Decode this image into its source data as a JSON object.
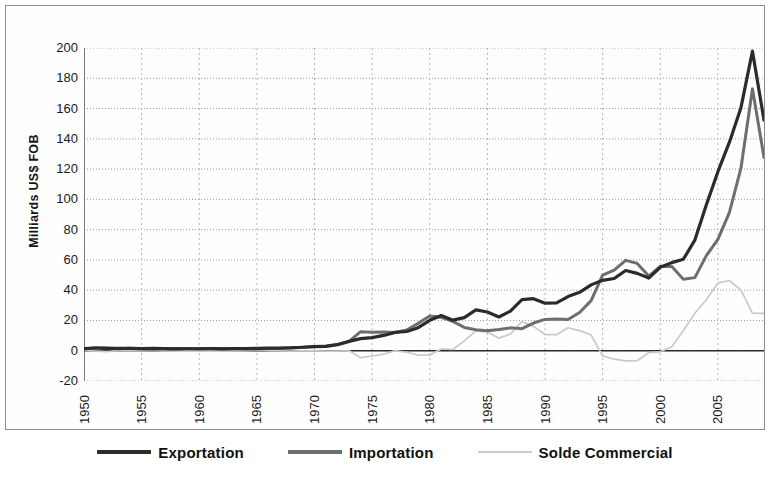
{
  "chart_data": {
    "type": "line",
    "title": "",
    "xlabel": "",
    "ylabel": "Milliards US$ FOB",
    "xlim": [
      1950,
      2009
    ],
    "ylim": [
      -20,
      200
    ],
    "ytick_labels": [
      "200",
      "180",
      "160",
      "140",
      "120",
      "100",
      "80",
      "60",
      "40",
      "20",
      "0",
      "-20"
    ],
    "ytick_values": [
      200,
      180,
      160,
      140,
      120,
      100,
      80,
      60,
      40,
      20,
      0,
      -20
    ],
    "xtick_labels": [
      "1950",
      "1955",
      "1960",
      "1965",
      "1970",
      "1975",
      "1980",
      "1985",
      "1990",
      "1995",
      "2000",
      "2005"
    ],
    "xtick_values": [
      1950,
      1955,
      1960,
      1965,
      1970,
      1975,
      1980,
      1985,
      1990,
      1995,
      2000,
      2005
    ],
    "grid": true,
    "legend_position": "bottom",
    "x": [
      1950,
      1951,
      1952,
      1953,
      1954,
      1955,
      1956,
      1957,
      1958,
      1959,
      1960,
      1961,
      1962,
      1963,
      1964,
      1965,
      1966,
      1967,
      1968,
      1969,
      1970,
      1971,
      1972,
      1973,
      1974,
      1975,
      1976,
      1977,
      1978,
      1979,
      1980,
      1981,
      1982,
      1983,
      1984,
      1985,
      1986,
      1987,
      1988,
      1989,
      1990,
      1991,
      1992,
      1993,
      1994,
      1995,
      1996,
      1997,
      1998,
      1999,
      2000,
      2001,
      2002,
      2003,
      2004,
      2005,
      2006,
      2007,
      2008,
      2009
    ],
    "series": [
      {
        "name": "Exportation",
        "color": "#2b2b2b",
        "values": [
          1.4,
          1.8,
          1.4,
          1.5,
          1.6,
          1.4,
          1.5,
          1.4,
          1.2,
          1.3,
          1.3,
          1.4,
          1.2,
          1.4,
          1.4,
          1.6,
          1.7,
          1.7,
          1.9,
          2.3,
          2.7,
          2.9,
          4.0,
          6.2,
          8.0,
          8.7,
          10.1,
          12.1,
          12.7,
          15.2,
          20.1,
          23.3,
          20.2,
          21.9,
          27.0,
          25.6,
          22.3,
          26.2,
          33.8,
          34.4,
          31.4,
          31.6,
          35.8,
          38.6,
          43.5,
          46.5,
          47.7,
          53.0,
          51.1,
          48.0,
          55.1,
          58.2,
          60.4,
          73.1,
          96.5,
          118.3,
          137.8,
          160.6,
          197.9,
          152.3
        ]
      },
      {
        "name": "Importation",
        "color": "#6e6e6e",
        "values": [
          1.1,
          2.0,
          2.0,
          1.3,
          1.6,
          1.3,
          1.2,
          1.5,
          1.4,
          1.4,
          1.5,
          1.5,
          1.5,
          1.5,
          1.3,
          1.1,
          1.5,
          1.7,
          2.1,
          2.3,
          2.8,
          3.2,
          4.2,
          6.2,
          12.6,
          12.2,
          12.4,
          12.0,
          13.7,
          18.1,
          23.0,
          22.1,
          19.4,
          15.4,
          13.9,
          13.2,
          14.0,
          15.1,
          14.6,
          18.3,
          20.7,
          21.0,
          20.6,
          25.3,
          33.1,
          49.9,
          53.3,
          59.7,
          57.7,
          49.3,
          55.8,
          55.6,
          47.2,
          48.3,
          62.8,
          73.6,
          91.4,
          120.6,
          173.1,
          127.6
        ]
      },
      {
        "name": "Solde Commercial",
        "color": "#c9c9c9",
        "values": [
          0.3,
          -0.2,
          -0.6,
          0.2,
          0.0,
          0.1,
          0.3,
          -0.1,
          -0.2,
          -0.1,
          -0.2,
          -0.1,
          -0.3,
          -0.1,
          0.1,
          0.5,
          0.2,
          0.0,
          -0.2,
          0.0,
          -0.1,
          -0.3,
          -0.2,
          0.0,
          -4.6,
          -3.5,
          -2.3,
          0.1,
          -1.0,
          -2.9,
          -2.9,
          1.2,
          0.8,
          6.5,
          13.1,
          12.4,
          8.3,
          11.1,
          19.2,
          16.1,
          10.7,
          10.6,
          15.2,
          13.3,
          10.4,
          -3.4,
          -5.6,
          -6.7,
          -6.6,
          -1.3,
          -0.7,
          2.6,
          13.2,
          24.8,
          33.7,
          44.7,
          46.4,
          40.0,
          24.8,
          24.7
        ]
      }
    ]
  },
  "axes": {
    "y_title": "Milliards US$ FOB"
  },
  "legend": {
    "items": [
      {
        "label": "Exportation",
        "swatch": "line-thick-dark"
      },
      {
        "label": "Importation",
        "swatch": "line-thick-gray"
      },
      {
        "label": "Solde Commercial",
        "swatch": "line-thin-light"
      }
    ]
  }
}
